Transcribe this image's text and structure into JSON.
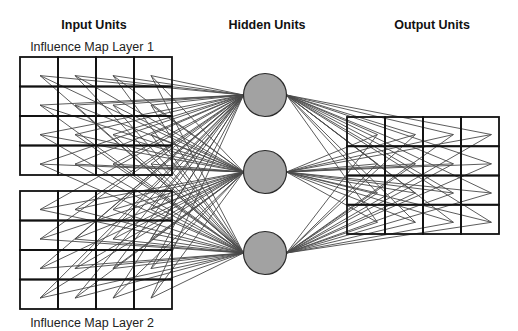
{
  "diagram": {
    "title_input": "Input Units",
    "title_hidden": "Hidden Units",
    "title_output": "Output Units",
    "input_layers": [
      {
        "label": "Influence Map Layer 1",
        "rows": 4,
        "cols": 4
      },
      {
        "label": "Influence Map Layer 2",
        "rows": 4,
        "cols": 4
      }
    ],
    "hidden_units": {
      "count": 3
    },
    "output_layer": {
      "rows": 4,
      "cols": 4
    },
    "connectivity": "fully-connected",
    "colors": {
      "connection": "#4a4a4a",
      "grid": "#111111",
      "node_fill": "#a2a2a2",
      "node_stroke": "#2a2a2a"
    }
  }
}
